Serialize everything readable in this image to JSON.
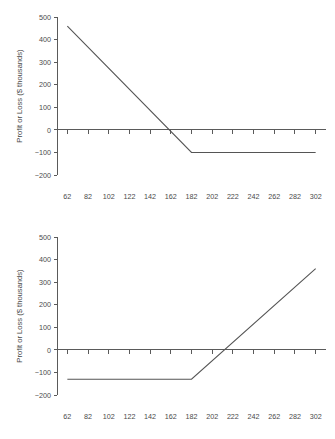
{
  "figure": {
    "panel_count": 2,
    "background_color": "#ffffff",
    "line_color": "#555555",
    "axis_color": "#5a5a5a"
  },
  "chart_data": [
    {
      "type": "line",
      "title": "",
      "subtitle": "",
      "xlabel": "",
      "ylabel": "Profit or Loss ($ thousands)",
      "xlim": [
        52,
        312
      ],
      "ylim": [
        -200,
        500
      ],
      "grid": false,
      "legend": "none",
      "xticks": [
        62,
        82,
        102,
        122,
        142,
        162,
        182,
        202,
        222,
        242,
        262,
        282,
        302
      ],
      "xtick_labels": [
        "62",
        "82",
        "102",
        "122",
        "142",
        "162",
        "182",
        "202",
        "222",
        "242",
        "262",
        "282",
        "302"
      ],
      "yticks": [
        -200,
        -100,
        0,
        100,
        200,
        300,
        400,
        500
      ],
      "ytick_labels": [
        "−200",
        "−100",
        "0",
        "100",
        "200",
        "300",
        "400",
        "500"
      ],
      "series": [
        {
          "name": "Profit or Loss",
          "x": [
            62,
            182,
            302
          ],
          "values": [
            460,
            -100,
            -100
          ]
        }
      ],
      "annotations": {
        "breakeven_x": 172,
        "plateau_value": -100,
        "kink_x": 182
      }
    },
    {
      "type": "line",
      "title": "",
      "subtitle": "",
      "xlabel": "",
      "ylabel": "Profit or Loss ($ thousands)",
      "xlim": [
        52,
        312
      ],
      "ylim": [
        -200,
        500
      ],
      "grid": false,
      "legend": "none",
      "xticks": [
        62,
        82,
        102,
        122,
        142,
        162,
        182,
        202,
        222,
        242,
        262,
        282,
        302
      ],
      "xtick_labels": [
        "62",
        "82",
        "102",
        "122",
        "142",
        "162",
        "182",
        "202",
        "222",
        "242",
        "262",
        "282",
        "302"
      ],
      "yticks": [
        -200,
        -100,
        0,
        100,
        200,
        300,
        400,
        500
      ],
      "ytick_labels": [
        "−200",
        "−100",
        "0",
        "100",
        "200",
        "300",
        "400",
        "500"
      ],
      "series": [
        {
          "name": "Profit or Loss",
          "x": [
            62,
            182,
            302
          ],
          "values": [
            -130,
            -130,
            360
          ]
        }
      ],
      "annotations": {
        "breakeven_x": 212,
        "plateau_value": -130,
        "kink_x": 182
      }
    }
  ]
}
